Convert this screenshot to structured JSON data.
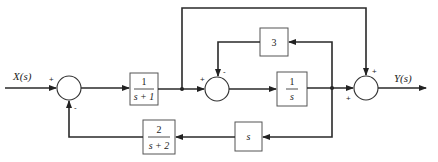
{
  "diagram": {
    "type": "block-diagram",
    "input_label": "X(s)",
    "output_label": "Y(s)",
    "blocks": [
      {
        "id": "g1",
        "num": "1",
        "den": "s + 1"
      },
      {
        "id": "g2",
        "num": "1",
        "den": "s"
      },
      {
        "id": "h3",
        "text": "3"
      },
      {
        "id": "hs",
        "text": "s"
      },
      {
        "id": "h2",
        "num": "2",
        "den": "s + 2"
      }
    ],
    "summers": [
      {
        "id": "sum1",
        "signs": [
          "+",
          "-"
        ]
      },
      {
        "id": "sum2",
        "signs": [
          "+",
          "-"
        ]
      },
      {
        "id": "sum3",
        "signs": [
          "+",
          "+"
        ]
      }
    ]
  }
}
